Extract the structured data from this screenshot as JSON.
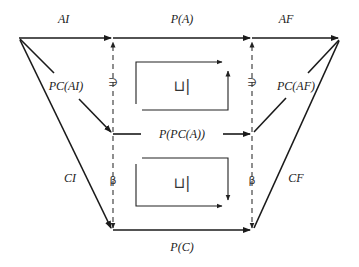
{
  "diagram": {
    "type": "commutative-diagram",
    "labels": {
      "top_left_edge": "AI",
      "top_middle_edge": "P(A)",
      "top_right_edge": "AF",
      "left_upper_diag": "PC(AI)",
      "right_upper_diag": "PC(AF)",
      "middle_edge": "P(PC(A))",
      "left_lower_diag": "CI",
      "right_lower_diag": "CF",
      "bottom_edge": "P(C)",
      "left_upper_vertical": "∋",
      "right_upper_vertical": "∋",
      "left_lower_vertical": "β",
      "right_lower_vertical": "β",
      "upper_box_symbol": "⊔|",
      "lower_box_symbol": "⊔|"
    },
    "colors": {
      "line": "#1a1a1a",
      "text": "#222222",
      "background": "#ffffff"
    }
  }
}
